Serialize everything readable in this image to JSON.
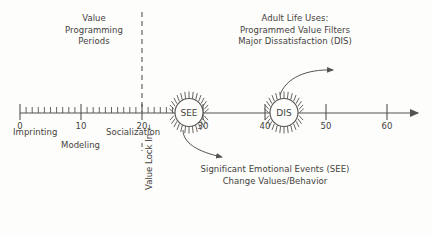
{
  "figure": {
    "title_left": "Value\nProgramming\nPeriods",
    "title_right": "Adult Life Uses:\nProgrammed Value Filters\nMajor Dissatisfaction (DIS)",
    "note_bottom": "Significant Emotional Events (SEE)\nChange Values/Behavior",
    "vertical_label": "Value Lock In ←"
  },
  "axis": {
    "tick_labels": [
      "0",
      "10",
      "20",
      "30",
      "40",
      "50",
      "60"
    ],
    "tick_values": [
      0,
      10,
      20,
      30,
      40,
      50,
      60
    ],
    "minor_step": 1,
    "minor_range": [
      0,
      30
    ],
    "stage_labels": [
      {
        "text": "Imprinting",
        "at": 0
      },
      {
        "text": "Modeling",
        "at": 8
      },
      {
        "text": "Socialization",
        "at": 17
      }
    ]
  },
  "events": [
    {
      "id": "see",
      "label": "SEE",
      "at": 28.5
    },
    {
      "id": "dis",
      "label": "DIS",
      "at": 41.5
    }
  ],
  "colors": {
    "ink": "#555350",
    "text": "#444240",
    "background": "#fdfdfb"
  }
}
